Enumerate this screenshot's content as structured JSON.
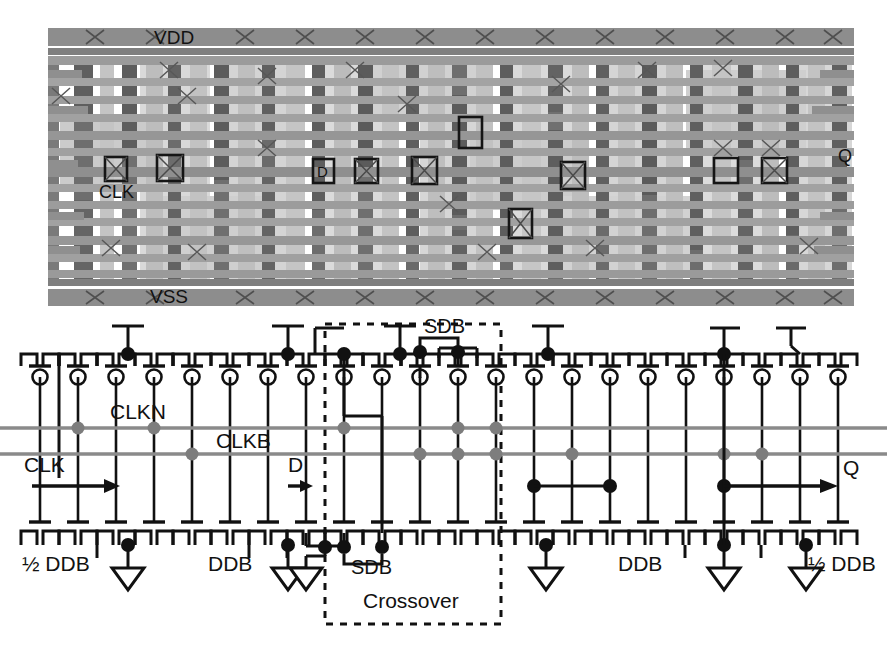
{
  "figure": {
    "type": "vlsi-layout-and-schematic",
    "panels": [
      "layout",
      "schematic"
    ]
  },
  "layout": {
    "caption_labels": {
      "vdd": "VDD",
      "vss": "VSS",
      "clk": "CLK",
      "d": "D",
      "q": "Q"
    },
    "colors": {
      "background": "#ffffff",
      "metal_rail": "#8d8d8d",
      "poly_vertical": "#6f6f6f",
      "metal_horizontal": "#9a9a9a",
      "diffusion_light": "#c6c6c6",
      "diffusion_lighter": "#d8d8d8",
      "via_mark": "#5a5a5a",
      "highlight_box": "#1a1a1a"
    },
    "bounds": {
      "x": 48,
      "y": 26,
      "width": 806,
      "height": 280
    },
    "power_rails": [
      {
        "name": "vdd-rail",
        "y": 28,
        "height": 18
      },
      {
        "name": "vdd-metal-line",
        "y": 47,
        "height": 6
      },
      {
        "name": "vss-metal-line",
        "y": 281,
        "height": 6
      },
      {
        "name": "vss-rail",
        "y": 289,
        "height": 17
      }
    ],
    "horizontal_tracks": [
      56,
      78,
      96,
      114,
      131,
      148,
      165,
      182,
      199,
      216,
      234,
      252,
      268
    ],
    "vertical_stripes": [
      {
        "x": 48,
        "w": 10,
        "y": 57,
        "h": 222,
        "tone": "poly"
      },
      {
        "x": 74,
        "w": 18,
        "y": 57,
        "h": 222,
        "tone": "poly"
      },
      {
        "x": 100,
        "w": 14,
        "y": 57,
        "h": 222,
        "tone": "diff"
      },
      {
        "x": 122,
        "w": 14,
        "y": 57,
        "h": 222,
        "tone": "poly"
      },
      {
        "x": 146,
        "w": 16,
        "y": 57,
        "h": 222,
        "tone": "diffL"
      },
      {
        "x": 168,
        "w": 12,
        "y": 57,
        "h": 222,
        "tone": "poly"
      },
      {
        "x": 190,
        "w": 16,
        "y": 57,
        "h": 222,
        "tone": "diff"
      },
      {
        "x": 214,
        "w": 14,
        "y": 57,
        "h": 222,
        "tone": "poly"
      },
      {
        "x": 238,
        "w": 16,
        "y": 57,
        "h": 222,
        "tone": "diffL"
      },
      {
        "x": 262,
        "w": 12,
        "y": 57,
        "h": 222,
        "tone": "poly"
      },
      {
        "x": 286,
        "w": 18,
        "y": 57,
        "h": 222,
        "tone": "diff"
      },
      {
        "x": 312,
        "w": 12,
        "y": 57,
        "h": 222,
        "tone": "poly"
      },
      {
        "x": 334,
        "w": 16,
        "y": 57,
        "h": 222,
        "tone": "diffL"
      },
      {
        "x": 358,
        "w": 14,
        "y": 57,
        "h": 222,
        "tone": "poly"
      },
      {
        "x": 382,
        "w": 16,
        "y": 57,
        "h": 222,
        "tone": "diff"
      },
      {
        "x": 406,
        "w": 12,
        "y": 57,
        "h": 222,
        "tone": "poly"
      },
      {
        "x": 428,
        "w": 16,
        "y": 57,
        "h": 222,
        "tone": "diffL"
      },
      {
        "x": 452,
        "w": 14,
        "y": 57,
        "h": 222,
        "tone": "poly"
      },
      {
        "x": 476,
        "w": 16,
        "y": 57,
        "h": 222,
        "tone": "diff"
      },
      {
        "x": 500,
        "w": 12,
        "y": 57,
        "h": 222,
        "tone": "poly"
      },
      {
        "x": 522,
        "w": 18,
        "y": 57,
        "h": 222,
        "tone": "diffL"
      },
      {
        "x": 548,
        "w": 14,
        "y": 57,
        "h": 222,
        "tone": "poly"
      },
      {
        "x": 572,
        "w": 16,
        "y": 57,
        "h": 222,
        "tone": "diff"
      },
      {
        "x": 596,
        "w": 12,
        "y": 57,
        "h": 222,
        "tone": "poly"
      },
      {
        "x": 618,
        "w": 16,
        "y": 57,
        "h": 222,
        "tone": "diffL"
      },
      {
        "x": 642,
        "w": 14,
        "y": 57,
        "h": 222,
        "tone": "poly"
      },
      {
        "x": 666,
        "w": 16,
        "y": 57,
        "h": 222,
        "tone": "diff"
      },
      {
        "x": 690,
        "w": 12,
        "y": 57,
        "h": 222,
        "tone": "poly"
      },
      {
        "x": 712,
        "w": 18,
        "y": 57,
        "h": 222,
        "tone": "diffL"
      },
      {
        "x": 738,
        "w": 14,
        "y": 57,
        "h": 222,
        "tone": "poly"
      },
      {
        "x": 762,
        "w": 16,
        "y": 57,
        "h": 222,
        "tone": "diff"
      },
      {
        "x": 786,
        "w": 12,
        "y": 57,
        "h": 222,
        "tone": "poly"
      },
      {
        "x": 808,
        "w": 16,
        "y": 57,
        "h": 222,
        "tone": "diffL"
      },
      {
        "x": 832,
        "w": 14,
        "y": 57,
        "h": 222,
        "tone": "poly"
      }
    ],
    "highlight_boxes": [
      {
        "name": "clk-contact-a",
        "x": 105,
        "y": 157,
        "w": 22,
        "h": 24
      },
      {
        "name": "clk-contact-b",
        "x": 157,
        "y": 155,
        "w": 26,
        "h": 26
      },
      {
        "name": "d-contact",
        "x": 313,
        "y": 160,
        "w": 20,
        "h": 22
      },
      {
        "name": "contact-3",
        "x": 355,
        "y": 160,
        "w": 22,
        "h": 22
      },
      {
        "name": "contact-4",
        "x": 412,
        "y": 157,
        "w": 24,
        "h": 26
      },
      {
        "name": "contact-5",
        "x": 459,
        "y": 117,
        "w": 22,
        "h": 30
      },
      {
        "name": "contact-6",
        "x": 561,
        "y": 163,
        "w": 24,
        "h": 26
      },
      {
        "name": "contact-7",
        "x": 510,
        "y": 210,
        "w": 22,
        "h": 28
      },
      {
        "name": "contact-8",
        "x": 714,
        "y": 159,
        "w": 24,
        "h": 24
      },
      {
        "name": "contact-9",
        "x": 763,
        "y": 159,
        "w": 24,
        "h": 24
      }
    ]
  },
  "schematic": {
    "signals": {
      "clk": "CLK",
      "clkn": "CLKN",
      "clkb": "CLKB",
      "d": "D",
      "q": "Q",
      "sdb_top": "SDB",
      "sdb_bottom": "SDB"
    },
    "region_labels": [
      {
        "name": "half-ddb-left",
        "text": "½ DDB",
        "x": 30,
        "y": 572
      },
      {
        "name": "ddb-left",
        "text": "DDB",
        "x": 214,
        "y": 572
      },
      {
        "name": "sdb-bottom",
        "text": "SDB",
        "x": 363,
        "y": 570
      },
      {
        "name": "crossover",
        "text": "Crossover",
        "x": 375,
        "y": 608
      },
      {
        "name": "ddb-right",
        "text": "DDB",
        "x": 628,
        "y": 572
      },
      {
        "name": "half-ddb-right",
        "text": "½ DDB",
        "x": 800,
        "y": 572
      }
    ],
    "crossover_box": {
      "x": 325,
      "y": 324,
      "width": 175,
      "height": 300,
      "style": "dashed"
    },
    "colors": {
      "wire": "#111111",
      "clock_wire": "#8a8a8a",
      "node_dot": "#111111",
      "clock_node_dot": "#7a7a7a",
      "dashed_box": "#111111"
    },
    "rows": {
      "pmos_rail_y": 366,
      "pmos_gate_y": 382,
      "clkn_y": 428,
      "clkb_y": 453,
      "io_arrow_y": 487,
      "nmos_gate_y": 522,
      "nmos_rail_y": 545
    },
    "pmos_columns": [
      40,
      78,
      116,
      154,
      192,
      230,
      268,
      306,
      344,
      382,
      420,
      458,
      496,
      534,
      572,
      610,
      648,
      686,
      724,
      762,
      800,
      838
    ],
    "transistor_counts": {
      "pmos": 22,
      "nmos": 22
    },
    "vdd_stubs_x": [
      128,
      288,
      398,
      548,
      722,
      788
    ],
    "ground_symbols_x": [
      128,
      288,
      385,
      546,
      722,
      806
    ]
  }
}
